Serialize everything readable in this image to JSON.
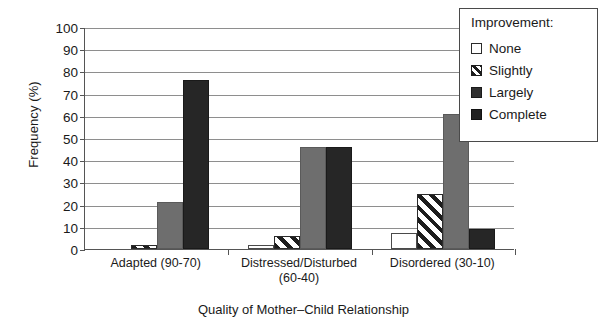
{
  "chart_data": {
    "type": "bar",
    "title": "",
    "xlabel": "Quality of Mother–Child Relationship",
    "ylabel": "Frequency (%)",
    "categories": [
      "Adapted (90-70)",
      "Distressed/Disturbed\n(60-40)",
      "Disordered (30-10)"
    ],
    "series": [
      {
        "name": "None",
        "values": [
          0,
          2,
          7
        ],
        "fill": "white",
        "color": "#ffffff"
      },
      {
        "name": "Slightly",
        "values": [
          2,
          6,
          25
        ],
        "fill": "diagonal-hatch",
        "color": "#1d1d1d"
      },
      {
        "name": "Largely",
        "values": [
          21,
          46,
          61
        ],
        "fill": "solid",
        "color": "#6e6e6e"
      },
      {
        "name": "Complete",
        "values": [
          76,
          46,
          9
        ],
        "fill": "solid",
        "color": "#262626"
      }
    ],
    "ylim": [
      0,
      100
    ],
    "yticks": [
      0,
      10,
      20,
      30,
      40,
      50,
      60,
      70,
      80,
      90,
      100
    ],
    "ytick_labels": [
      "0",
      "10",
      "20",
      "30",
      "40",
      "50",
      "60",
      "70",
      "80",
      "90",
      "100"
    ],
    "grid": "horizontal",
    "legend_position": "top-right",
    "legend_title": "Improvement:"
  },
  "axes": {
    "y_title": "Frequency (%)",
    "x_title": "Quality of Mother–Child Relationship",
    "y_ticks": [
      "100",
      "90",
      "80",
      "70",
      "60",
      "50",
      "40",
      "30",
      "20",
      "10",
      "0"
    ],
    "x_ticks": [
      {
        "line1": "Adapted (90-70)",
        "line2": ""
      },
      {
        "line1": "Distressed/Disturbed",
        "line2": "(60-40)"
      },
      {
        "line1": "Disordered (30-10)",
        "line2": ""
      }
    ]
  },
  "legend": {
    "title": "Improvement:",
    "items": [
      {
        "label": "None"
      },
      {
        "label": "Slightly"
      },
      {
        "label": "Largely"
      },
      {
        "label": "Complete"
      }
    ]
  }
}
